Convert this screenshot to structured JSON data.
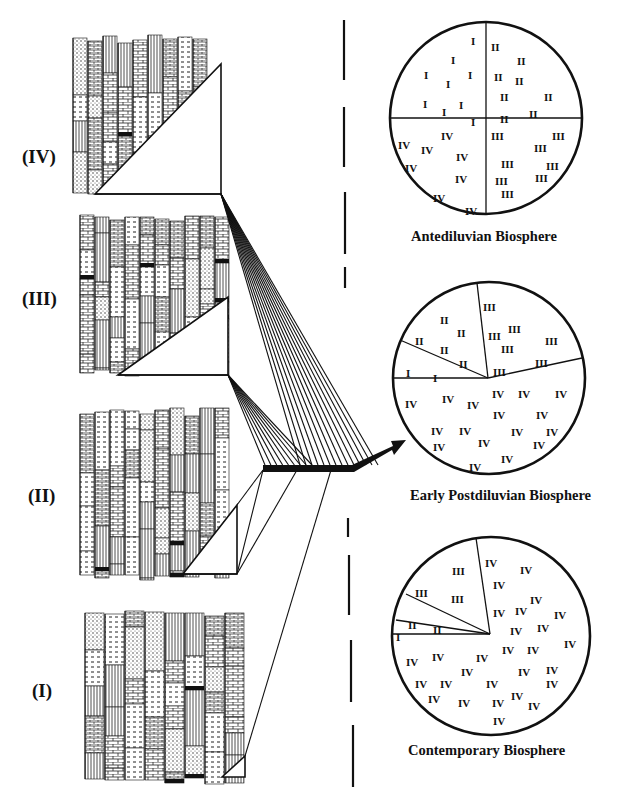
{
  "figure": {
    "sections": [
      {
        "id": "IV",
        "label": "(IV)",
        "label_x": 26,
        "label_y": 87
      },
      {
        "id": "III",
        "label": "(III)",
        "label_x": 22,
        "label_y": 290
      },
      {
        "id": "II",
        "label": "(II)",
        "label_x": 28,
        "label_y": 492
      },
      {
        "id": "I",
        "label": "(I)",
        "label_x": 32,
        "label_y": 687
      }
    ],
    "biospheres": [
      {
        "name": "Antediluvian Biosphere",
        "cx": 486,
        "cy": 118,
        "r": 96,
        "caption_x": 420,
        "caption_y": 222,
        "divisions": [
          {
            "from": [
              486,
              22
            ],
            "to": [
              486,
              214
            ]
          },
          {
            "from": [
              390,
              118
            ],
            "to": [
              582,
              118
            ]
          }
        ],
        "labels": [
          {
            "t": "I",
            "x": 471,
            "y": 36
          },
          {
            "t": "I",
            "x": 451,
            "y": 55
          },
          {
            "t": "I",
            "x": 424,
            "y": 70
          },
          {
            "t": "I",
            "x": 446,
            "y": 79
          },
          {
            "t": "I",
            "x": 468,
            "y": 70
          },
          {
            "t": "I",
            "x": 423,
            "y": 99
          },
          {
            "t": "I",
            "x": 442,
            "y": 107
          },
          {
            "t": "I",
            "x": 459,
            "y": 100
          },
          {
            "t": "I",
            "x": 471,
            "y": 117
          },
          {
            "t": "II",
            "x": 491,
            "y": 42
          },
          {
            "t": "II",
            "x": 517,
            "y": 56
          },
          {
            "t": "II",
            "x": 494,
            "y": 72
          },
          {
            "t": "II",
            "x": 515,
            "y": 76
          },
          {
            "t": "II",
            "x": 500,
            "y": 92
          },
          {
            "t": "II",
            "x": 544,
            "y": 92
          },
          {
            "t": "II",
            "x": 500,
            "y": 114
          },
          {
            "t": "II",
            "x": 529,
            "y": 109
          },
          {
            "t": "III",
            "x": 491,
            "y": 131
          },
          {
            "t": "III",
            "x": 552,
            "y": 131
          },
          {
            "t": "III",
            "x": 534,
            "y": 143
          },
          {
            "t": "III",
            "x": 501,
            "y": 159
          },
          {
            "t": "III",
            "x": 546,
            "y": 161
          },
          {
            "t": "III",
            "x": 495,
            "y": 176
          },
          {
            "t": "III",
            "x": 535,
            "y": 173
          },
          {
            "t": "III",
            "x": 501,
            "y": 189
          },
          {
            "t": "IV",
            "x": 441,
            "y": 131
          },
          {
            "t": "IV",
            "x": 398,
            "y": 140
          },
          {
            "t": "IV",
            "x": 421,
            "y": 145
          },
          {
            "t": "IV",
            "x": 456,
            "y": 152
          },
          {
            "t": "IV",
            "x": 405,
            "y": 163
          },
          {
            "t": "IV",
            "x": 455,
            "y": 174
          },
          {
            "t": "IV",
            "x": 433,
            "y": 193
          },
          {
            "t": "IV",
            "x": 465,
            "y": 206
          }
        ]
      },
      {
        "name": "Early Postdiluvian Biosphere",
        "cx": 489,
        "cy": 378,
        "r": 96,
        "caption_x": 409,
        "caption_y": 484,
        "divisions": [
          {
            "from": [
              488,
              378
            ],
            "to": [
              393,
              378
            ]
          },
          {
            "from": [
              488,
              378
            ],
            "to": [
              400,
              340
            ]
          },
          {
            "from": [
              488,
              378
            ],
            "to": [
              477,
              283
            ]
          },
          {
            "from": [
              488,
              378
            ],
            "to": [
              582,
              358
            ]
          }
        ],
        "labels": [
          {
            "t": "I",
            "x": 406,
            "y": 368
          },
          {
            "t": "I",
            "x": 433,
            "y": 373
          },
          {
            "t": "II",
            "x": 440,
            "y": 315
          },
          {
            "t": "II",
            "x": 457,
            "y": 328
          },
          {
            "t": "II",
            "x": 415,
            "y": 336
          },
          {
            "t": "II",
            "x": 440,
            "y": 345
          },
          {
            "t": "II",
            "x": 459,
            "y": 359
          },
          {
            "t": "III",
            "x": 483,
            "y": 302
          },
          {
            "t": "III",
            "x": 508,
            "y": 324
          },
          {
            "t": "III",
            "x": 488,
            "y": 331
          },
          {
            "t": "III",
            "x": 501,
            "y": 344
          },
          {
            "t": "III",
            "x": 545,
            "y": 336
          },
          {
            "t": "III",
            "x": 493,
            "y": 367
          },
          {
            "t": "III",
            "x": 535,
            "y": 358
          },
          {
            "t": "IV",
            "x": 492,
            "y": 389
          },
          {
            "t": "IV",
            "x": 518,
            "y": 389
          },
          {
            "t": "IV",
            "x": 555,
            "y": 389
          },
          {
            "t": "IV",
            "x": 405,
            "y": 399
          },
          {
            "t": "IV",
            "x": 442,
            "y": 394
          },
          {
            "t": "IV",
            "x": 467,
            "y": 400
          },
          {
            "t": "IV",
            "x": 493,
            "y": 410
          },
          {
            "t": "IV",
            "x": 536,
            "y": 410
          },
          {
            "t": "IV",
            "x": 431,
            "y": 426
          },
          {
            "t": "IV",
            "x": 459,
            "y": 426
          },
          {
            "t": "IV",
            "x": 511,
            "y": 427
          },
          {
            "t": "IV",
            "x": 546,
            "y": 427
          },
          {
            "t": "IV",
            "x": 433,
            "y": 442
          },
          {
            "t": "IV",
            "x": 478,
            "y": 438
          },
          {
            "t": "IV",
            "x": 533,
            "y": 440
          },
          {
            "t": "IV",
            "x": 501,
            "y": 454
          },
          {
            "t": "IV",
            "x": 469,
            "y": 462
          }
        ]
      },
      {
        "name": "Contemporary Biosphere",
        "cx": 491,
        "cy": 636,
        "r": 99,
        "caption_x": 418,
        "caption_y": 740,
        "divisions": [
          {
            "from": [
              490,
              634
            ],
            "to": [
              393,
              634
            ]
          },
          {
            "from": [
              490,
              634
            ],
            "to": [
              396,
              620
            ]
          },
          {
            "from": [
              490,
              634
            ],
            "to": [
              406,
              594
            ]
          },
          {
            "from": [
              490,
              634
            ],
            "to": [
              476,
              538
            ]
          }
        ],
        "labels": [
          {
            "t": "I",
            "x": 396,
            "y": 632
          },
          {
            "t": "II",
            "x": 408,
            "y": 620
          },
          {
            "t": "II",
            "x": 433,
            "y": 625
          },
          {
            "t": "III",
            "x": 452,
            "y": 566
          },
          {
            "t": "III",
            "x": 415,
            "y": 588
          },
          {
            "t": "III",
            "x": 451,
            "y": 594
          },
          {
            "t": "IV",
            "x": 485,
            "y": 558
          },
          {
            "t": "IV",
            "x": 520,
            "y": 565
          },
          {
            "t": "IV",
            "x": 493,
            "y": 580
          },
          {
            "t": "IV",
            "x": 530,
            "y": 595
          },
          {
            "t": "IV",
            "x": 493,
            "y": 608
          },
          {
            "t": "IV",
            "x": 515,
            "y": 606
          },
          {
            "t": "IV",
            "x": 554,
            "y": 610
          },
          {
            "t": "IV",
            "x": 510,
            "y": 626
          },
          {
            "t": "IV",
            "x": 537,
            "y": 623
          },
          {
            "t": "IV",
            "x": 564,
            "y": 639
          },
          {
            "t": "IV",
            "x": 502,
            "y": 645
          },
          {
            "t": "IV",
            "x": 527,
            "y": 645
          },
          {
            "t": "IV",
            "x": 406,
            "y": 657
          },
          {
            "t": "IV",
            "x": 432,
            "y": 652
          },
          {
            "t": "IV",
            "x": 476,
            "y": 653
          },
          {
            "t": "IV",
            "x": 461,
            "y": 667
          },
          {
            "t": "IV",
            "x": 518,
            "y": 667
          },
          {
            "t": "IV",
            "x": 546,
            "y": 665
          },
          {
            "t": "IV",
            "x": 415,
            "y": 679
          },
          {
            "t": "IV",
            "x": 440,
            "y": 679
          },
          {
            "t": "IV",
            "x": 486,
            "y": 679
          },
          {
            "t": "IV",
            "x": 546,
            "y": 679
          },
          {
            "t": "IV",
            "x": 511,
            "y": 691
          },
          {
            "t": "IV",
            "x": 428,
            "y": 694
          },
          {
            "t": "IV",
            "x": 458,
            "y": 698
          },
          {
            "t": "IV",
            "x": 492,
            "y": 698
          },
          {
            "t": "IV",
            "x": 528,
            "y": 701
          },
          {
            "t": "IV",
            "x": 493,
            "y": 716
          }
        ]
      }
    ]
  }
}
